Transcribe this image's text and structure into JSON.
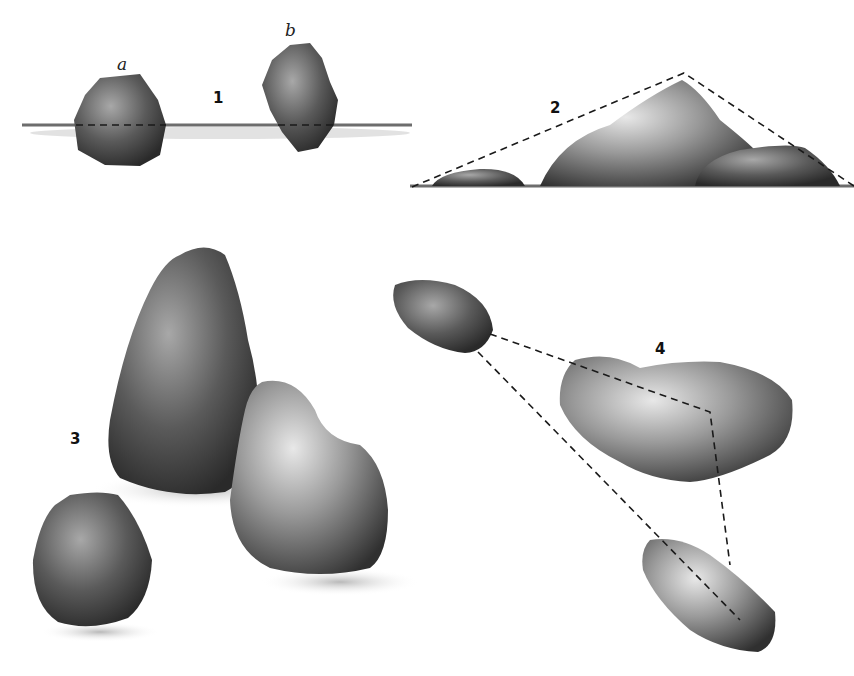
{
  "figure": {
    "panels": [
      {
        "id": "1",
        "label": "1",
        "description": "Two stones sitting on a ground line with dashed horizon lines",
        "sub_labels": [
          "a",
          "b"
        ]
      },
      {
        "id": "2",
        "label": "2",
        "description": "Group of three stones enclosed by a dashed triangle"
      },
      {
        "id": "3",
        "label": "3",
        "description": "Three rounded stones grouped with cast shadows"
      },
      {
        "id": "4",
        "label": "4",
        "description": "Three flat stones connected by dashed lines forming a triangle"
      }
    ],
    "colors": {
      "stone_dark": "#3a3a3a",
      "stone_mid": "#7a7a7a",
      "stone_light": "#d0d0d0",
      "line": "#1a1a1a",
      "background": "#ffffff"
    }
  }
}
